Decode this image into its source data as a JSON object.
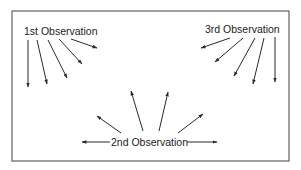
{
  "diagram": {
    "frame": {
      "x": 12,
      "y": 11,
      "width": 277,
      "height": 150,
      "stroke": "#6e6e6e"
    },
    "arrow_color": "#2a2a2a",
    "groups": [
      {
        "id": "first",
        "label": "1st Observation",
        "label_pos": {
          "x": 24,
          "y": 35
        },
        "arrows": [
          {
            "x1": 28,
            "y1": 40,
            "x2": 28,
            "y2": 87
          },
          {
            "x1": 37,
            "y1": 40,
            "x2": 47,
            "y2": 84
          },
          {
            "x1": 48,
            "y1": 40,
            "x2": 67,
            "y2": 78
          },
          {
            "x1": 59,
            "y1": 39,
            "x2": 82,
            "y2": 64
          },
          {
            "x1": 71,
            "y1": 39,
            "x2": 97,
            "y2": 48
          }
        ]
      },
      {
        "id": "third",
        "label": "3rd Observation",
        "label_pos": {
          "x": 205,
          "y": 33
        },
        "arrows": [
          {
            "x1": 230,
            "y1": 38,
            "x2": 201,
            "y2": 48
          },
          {
            "x1": 243,
            "y1": 38,
            "x2": 215,
            "y2": 62
          },
          {
            "x1": 255,
            "y1": 38,
            "x2": 234,
            "y2": 76
          },
          {
            "x1": 264,
            "y1": 38,
            "x2": 253,
            "y2": 84
          },
          {
            "x1": 275,
            "y1": 37,
            "x2": 275,
            "y2": 82
          }
        ]
      },
      {
        "id": "second",
        "label": "2nd Observation",
        "label_pos": {
          "x": 111,
          "y": 146
        },
        "arrows": [
          {
            "x1": 110,
            "y1": 142,
            "x2": 82,
            "y2": 142
          },
          {
            "x1": 187,
            "y1": 142,
            "x2": 217,
            "y2": 142
          },
          {
            "x1": 121,
            "y1": 133,
            "x2": 97,
            "y2": 116
          },
          {
            "x1": 143,
            "y1": 131,
            "x2": 131,
            "y2": 91
          },
          {
            "x1": 159,
            "y1": 131,
            "x2": 168,
            "y2": 92
          },
          {
            "x1": 178,
            "y1": 133,
            "x2": 203,
            "y2": 114
          }
        ]
      }
    ]
  }
}
